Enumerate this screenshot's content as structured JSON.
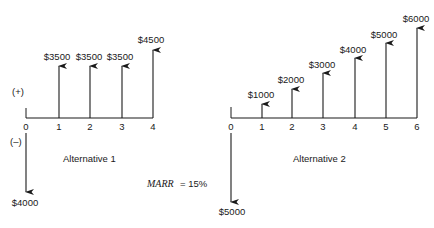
{
  "diagram": {
    "type": "cash-flow-diagram",
    "sign_labels": {
      "positive": "(+)",
      "negative": "(–)"
    },
    "marr": {
      "label": "MARR",
      "value": "= 15%"
    },
    "alternatives": [
      {
        "caption": "Alternative 1",
        "periods": [
          "0",
          "1",
          "2",
          "3",
          "4"
        ],
        "cash_flows": [
          {
            "period": 0,
            "amount": -4000,
            "label": "$4000"
          },
          {
            "period": 1,
            "amount": 3500,
            "label": "$3500"
          },
          {
            "period": 2,
            "amount": 3500,
            "label": "$3500"
          },
          {
            "period": 3,
            "amount": 3500,
            "label": "$3500"
          },
          {
            "period": 4,
            "amount": 4500,
            "label": "$4500"
          }
        ]
      },
      {
        "caption": "Alternative 2",
        "periods": [
          "0",
          "1",
          "2",
          "3",
          "4",
          "5",
          "6"
        ],
        "cash_flows": [
          {
            "period": 0,
            "amount": -5000,
            "label": "$5000"
          },
          {
            "period": 1,
            "amount": 1000,
            "label": "$1000"
          },
          {
            "period": 2,
            "amount": 2000,
            "label": "$2000"
          },
          {
            "period": 3,
            "amount": 3000,
            "label": "$3000"
          },
          {
            "period": 4,
            "amount": 4000,
            "label": "$4000"
          },
          {
            "period": 5,
            "amount": 5000,
            "label": "$5000"
          },
          {
            "period": 6,
            "amount": 6000,
            "label": "$6000"
          }
        ]
      }
    ]
  }
}
